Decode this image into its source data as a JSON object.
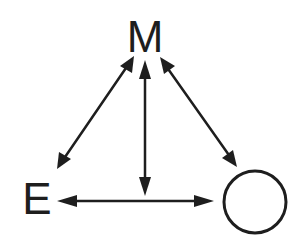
{
  "diagram": {
    "type": "triangle-relationship",
    "nodes": [
      {
        "id": "M",
        "label": "M",
        "shape": "text",
        "position": "top"
      },
      {
        "id": "E",
        "label": "E",
        "shape": "text",
        "position": "bottom-left"
      },
      {
        "id": "O",
        "label": "",
        "shape": "circle",
        "position": "bottom-right"
      }
    ],
    "edges": [
      {
        "from": "M",
        "to": "E",
        "direction": "bidirectional"
      },
      {
        "from": "M",
        "to": "horizontal-edge",
        "direction": "bidirectional",
        "note": "vertical arrow from M down to E–circle line"
      },
      {
        "from": "M",
        "to": "O",
        "direction": "bidirectional"
      },
      {
        "from": "E",
        "to": "O",
        "direction": "bidirectional"
      }
    ],
    "colors": {
      "stroke": "#1e1e1e",
      "background": "#ffffff"
    }
  }
}
